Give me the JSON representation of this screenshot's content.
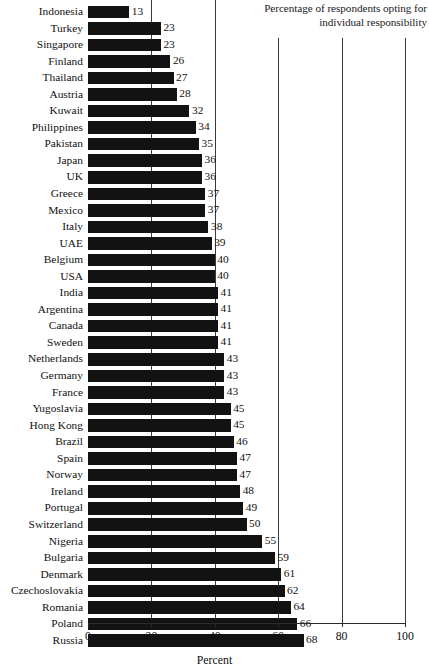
{
  "chart_data": {
    "type": "bar",
    "orientation": "horizontal",
    "title": "Percentage of respondents opting for individual responsibility",
    "xlabel": "Percent",
    "ylabel": "",
    "xlim": [
      0,
      100
    ],
    "xticks": [
      0,
      20,
      40,
      60,
      80,
      100
    ],
    "grid": true,
    "grid_axis": "x",
    "legend": false,
    "bar_color": "#121212",
    "categories": [
      "Indonesia",
      "Turkey",
      "Singapore",
      "Finland",
      "Thailand",
      "Austria",
      "Kuwait",
      "Philippines",
      "Pakistan",
      "Japan",
      "UK",
      "Greece",
      "Mexico",
      "Italy",
      "UAE",
      "Belgium",
      "USA",
      "India",
      "Argentina",
      "Canada",
      "Sweden",
      "Netherlands",
      "Germany",
      "France",
      "Yugoslavia",
      "Hong Kong",
      "Brazil",
      "Spain",
      "Norway",
      "Ireland",
      "Portugal",
      "Switzerland",
      "Nigeria",
      "Bulgaria",
      "Denmark",
      "Czechoslovakia",
      "Romania",
      "Poland",
      "Russia"
    ],
    "values": [
      13,
      23,
      23,
      26,
      27,
      28,
      32,
      34,
      35,
      36,
      36,
      37,
      37,
      38,
      39,
      40,
      40,
      41,
      41,
      41,
      41,
      43,
      43,
      43,
      45,
      45,
      46,
      47,
      47,
      48,
      49,
      50,
      55,
      59,
      61,
      62,
      64,
      66,
      68
    ]
  },
  "axis": {
    "tick_labels": [
      "0",
      "20",
      "40",
      "60",
      "80",
      "100"
    ],
    "title": "Percent"
  }
}
